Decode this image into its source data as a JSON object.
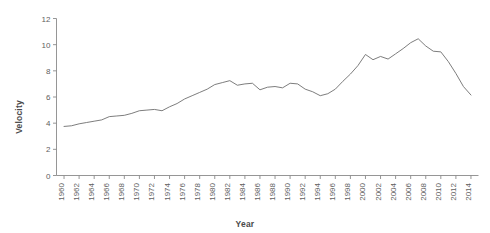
{
  "chart_data": {
    "type": "line",
    "title": "",
    "xlabel": "Year",
    "ylabel": "Velocity",
    "xlim": [
      1959,
      2015
    ],
    "ylim": [
      0,
      12
    ],
    "yticks": [
      0,
      2,
      4,
      6,
      8,
      10,
      12
    ],
    "xticks": [
      1960,
      1962,
      1964,
      1966,
      1968,
      1970,
      1972,
      1974,
      1976,
      1978,
      1980,
      1982,
      1984,
      1986,
      1988,
      1990,
      1992,
      1994,
      1996,
      1998,
      2000,
      2002,
      2004,
      2006,
      2008,
      2010,
      2012,
      2014
    ],
    "grid": false,
    "legend": false,
    "line_color": "#6e6e6e",
    "line_width": 0.9,
    "axis_color": "#8a8a8a",
    "x": [
      1960,
      1961,
      1962,
      1963,
      1964,
      1965,
      1966,
      1967,
      1968,
      1969,
      1970,
      1971,
      1972,
      1973,
      1974,
      1975,
      1976,
      1977,
      1978,
      1979,
      1980,
      1981,
      1982,
      1983,
      1984,
      1985,
      1986,
      1987,
      1988,
      1989,
      1990,
      1991,
      1992,
      1993,
      1994,
      1995,
      1996,
      1997,
      1998,
      1999,
      2000,
      2001,
      2002,
      2003,
      2004,
      2005,
      2006,
      2007,
      2008,
      2009,
      2010,
      2011,
      2012,
      2013,
      2014
    ],
    "values": [
      3.75,
      3.8,
      3.95,
      4.05,
      4.15,
      4.25,
      4.5,
      4.55,
      4.6,
      4.75,
      4.95,
      5.0,
      5.05,
      4.95,
      5.25,
      5.5,
      5.85,
      6.1,
      6.35,
      6.6,
      6.95,
      7.1,
      7.25,
      6.9,
      7.0,
      7.05,
      6.55,
      6.75,
      6.8,
      6.7,
      7.05,
      7.0,
      6.6,
      6.4,
      6.1,
      6.25,
      6.6,
      7.2,
      7.75,
      8.4,
      9.25,
      8.85,
      9.1,
      8.9,
      9.3,
      9.7,
      10.15,
      10.45,
      9.9,
      9.5,
      9.45,
      8.7,
      7.8,
      6.8,
      6.15
    ]
  },
  "axis": {
    "x_tick_labels": [
      "1960",
      "1962",
      "1964",
      "1966",
      "1968",
      "1970",
      "1972",
      "1974",
      "1976",
      "1978",
      "1980",
      "1982",
      "1984",
      "1986",
      "1988",
      "1990",
      "1992",
      "1994",
      "1996",
      "1998",
      "2000",
      "2002",
      "2004",
      "2006",
      "2008",
      "2010",
      "2012",
      "2014"
    ],
    "y_tick_labels": [
      "0",
      "2",
      "4",
      "6",
      "8",
      "10",
      "12"
    ]
  }
}
